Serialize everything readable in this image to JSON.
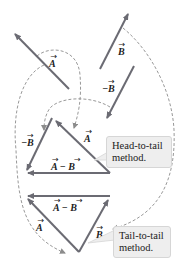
{
  "colors": {
    "vector": "#6b6b73",
    "dash": "#8c8c8c",
    "callout_bg": "#eeeeee",
    "text": "#222222"
  },
  "labels": {
    "A": "A",
    "B": "B",
    "neg_B": "−B",
    "A_minus_B": "A − B"
  },
  "callouts": {
    "head_to_tail": {
      "line1": "Head-to-tail",
      "line2": "method."
    },
    "tail_to_tail": {
      "line1": "Tail-to-tail",
      "line2": "method."
    }
  }
}
